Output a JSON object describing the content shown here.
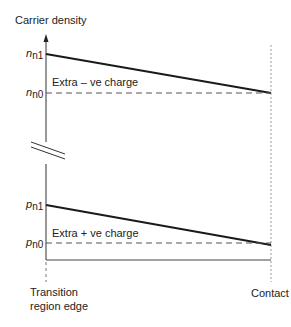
{
  "diagram": {
    "y_axis_label": "Carrier density",
    "levels": {
      "n_n1": {
        "base": "n",
        "sub": "n1"
      },
      "n_n0": {
        "base": "n",
        "sub": "n0"
      },
      "p_n1": {
        "base": "p",
        "sub": "n1"
      },
      "p_n0": {
        "base": "p",
        "sub": "n0"
      }
    },
    "region_labels": {
      "upper": "Extra – ve charge",
      "lower": "Extra + ve charge"
    },
    "x_labels": {
      "left_line1": "Transition",
      "left_line2": "region edge",
      "right": "Contact"
    },
    "axis_break": true,
    "colors": {
      "line": "#1a1a1a",
      "dashed": "#555555",
      "guide": "#999999"
    }
  }
}
